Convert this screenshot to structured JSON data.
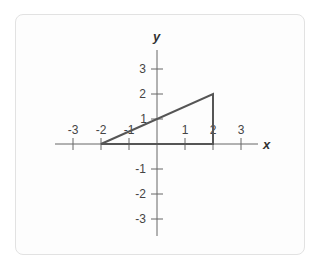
{
  "figure": {
    "x_axis_label": "x",
    "y_axis_label": "y",
    "x_ticks": [
      {
        "value": -3,
        "label": "-3"
      },
      {
        "value": -2,
        "label": "-2"
      },
      {
        "value": -1,
        "label": "-1"
      },
      {
        "value": 1,
        "label": "1"
      },
      {
        "value": 2,
        "label": "2"
      },
      {
        "value": 3,
        "label": "3"
      }
    ],
    "y_ticks": [
      {
        "value": 3,
        "label": "3"
      },
      {
        "value": 2,
        "label": "2"
      },
      {
        "value": 1,
        "label": "1"
      },
      {
        "value": -1,
        "label": "-1"
      },
      {
        "value": -2,
        "label": "-2"
      },
      {
        "value": -3,
        "label": "-3"
      }
    ],
    "triangle": {
      "vertices": [
        [
          -2,
          0
        ],
        [
          2,
          0
        ],
        [
          2,
          2
        ]
      ],
      "stroke_color": "#555555"
    },
    "axis_color": "#666666",
    "xlim": [
      -3.3,
      3.6
    ],
    "ylim": [
      -3.6,
      3.8
    ]
  }
}
